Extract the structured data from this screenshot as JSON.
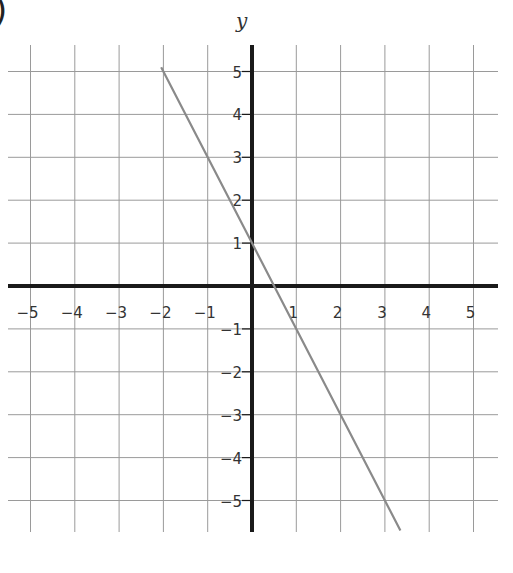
{
  "chart_data": {
    "type": "line",
    "title": "",
    "xlabel": "",
    "ylabel": "y",
    "xlim": [
      -5.5,
      5.5
    ],
    "ylim": [
      -5.75,
      5.75
    ],
    "grid": true,
    "x_ticks": [
      -5,
      -4,
      -3,
      -2,
      -1,
      1,
      2,
      3,
      4,
      5
    ],
    "y_ticks": [
      5,
      4,
      3,
      2,
      1,
      -1,
      -2,
      -3,
      -4,
      -5
    ],
    "x_tick_labels": [
      "−5",
      "−4",
      "−3",
      "−2",
      "−1",
      "1",
      "2",
      "3",
      "4",
      "5"
    ],
    "y_tick_labels": [
      "5",
      "4",
      "3",
      "2",
      "1",
      "−1",
      "−2",
      "−3",
      "−4",
      "−5"
    ],
    "series": [
      {
        "name": "y = -2x + 1",
        "slope": -2,
        "intercept": 1,
        "x": [
          -2.05,
          -1,
          0,
          1,
          2,
          3,
          3.35
        ],
        "y": [
          5.1,
          3,
          1,
          -1,
          -3,
          -5,
          -5.7
        ],
        "color": "#8a8a8a"
      }
    ],
    "legend": null
  },
  "labels": {
    "y_axis_title": "y",
    "part_marker": ")"
  },
  "colors": {
    "axis": "#1a1a1a",
    "grid": "#9a9a9a",
    "line": "#8a8a8a",
    "text": "#333333"
  }
}
